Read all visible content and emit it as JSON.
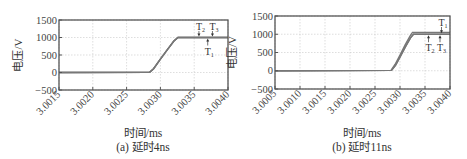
{
  "chart_data": [
    {
      "type": "line",
      "panel": "a",
      "caption": "(a) 延时4ns",
      "xlabel": "时间/ms",
      "ylabel": "电压/V",
      "xlim": [
        3.0015,
        3.004
      ],
      "ylim": [
        -500,
        1500
      ],
      "xticks": [
        "3.0015",
        "3.0020",
        "3.0025",
        "3.0030",
        "3.0035",
        "3.0040"
      ],
      "yticks": [
        "1500",
        "1000",
        "500",
        "0",
        "-500"
      ],
      "grid": true,
      "series": [
        {
          "name": "T1",
          "x": [
            3.0015,
            3.00284,
            3.0029,
            3.003,
            3.0031,
            3.0032,
            3.00326,
            3.004
          ],
          "y": [
            0,
            10,
            110,
            380,
            650,
            900,
            1000,
            1000
          ]
        },
        {
          "name": "T2",
          "x": [
            3.0015,
            3.00284,
            3.0029,
            3.003,
            3.0031,
            3.0032,
            3.00326,
            3.004
          ],
          "y": [
            0,
            10,
            110,
            380,
            650,
            900,
            1000,
            1000
          ]
        },
        {
          "name": "T3",
          "x": [
            3.0015,
            3.00284,
            3.0029,
            3.003,
            3.0031,
            3.0032,
            3.00326,
            3.004
          ],
          "y": [
            0,
            10,
            110,
            380,
            650,
            900,
            1000,
            1000
          ]
        }
      ],
      "annotations": [
        {
          "label": "T2",
          "base": "T",
          "sub": "2",
          "x": 3.00357,
          "arrow": "down"
        },
        {
          "label": "T3",
          "base": "T",
          "sub": "3",
          "x": 3.00377,
          "arrow": "down"
        },
        {
          "label": "T1",
          "base": "T",
          "sub": "1",
          "x": 3.0037,
          "arrow": "up"
        }
      ]
    },
    {
      "type": "line",
      "panel": "b",
      "caption": "(b) 延时11ns",
      "xlabel": "时间/ms",
      "ylabel": "电压/V",
      "xlim": [
        3.0005,
        3.004
      ],
      "ylim": [
        -500,
        1500
      ],
      "xticks": [
        "3.0005",
        "3.0010",
        "3.0015",
        "3.0020",
        "3.0025",
        "3.0030",
        "3.0035",
        "3.0040"
      ],
      "yticks": [
        "1500",
        "1000",
        "500",
        "0",
        "-500"
      ],
      "grid": true,
      "series": [
        {
          "name": "T1",
          "x": [
            3.0005,
            3.00282,
            3.0029,
            3.003,
            3.0031,
            3.0032,
            3.00325,
            3.004
          ],
          "y": [
            0,
            10,
            170,
            430,
            700,
            950,
            1050,
            1050
          ]
        },
        {
          "name": "T2",
          "x": [
            3.0005,
            3.00283,
            3.00291,
            3.00301,
            3.00311,
            3.00321,
            3.00327,
            3.004
          ],
          "y": [
            0,
            10,
            150,
            400,
            660,
            900,
            1000,
            1000
          ]
        },
        {
          "name": "T3",
          "x": [
            3.0005,
            3.00283,
            3.00291,
            3.00301,
            3.00311,
            3.00321,
            3.00327,
            3.004
          ],
          "y": [
            0,
            10,
            150,
            400,
            660,
            900,
            1000,
            1000
          ]
        }
      ],
      "annotations": [
        {
          "label": "T1",
          "base": "T",
          "sub": "1",
          "x": 3.00383,
          "arrow": "down"
        },
        {
          "label": "T2",
          "base": "T",
          "sub": "2",
          "x": 3.00357,
          "arrow": "up"
        },
        {
          "label": "T3",
          "base": "T",
          "sub": "3",
          "x": 3.0038,
          "arrow": "up"
        }
      ]
    }
  ],
  "panels": {
    "a": {
      "xlabel": "时间/ms",
      "ylabel": "电压/V",
      "caption": "(a) 延时4ns"
    },
    "b": {
      "xlabel": "时间/ms",
      "ylabel": "电压/V",
      "caption": "(b) 延时11ns"
    }
  },
  "colors": {
    "frame": "#555555",
    "grid": "#c8c8c8",
    "line": "#777777",
    "text": "#333333"
  }
}
